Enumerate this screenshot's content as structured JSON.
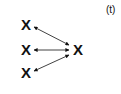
{
  "diagram": {
    "panel_label": "(t)",
    "nodes": [
      {
        "id": "left-top",
        "label": "X"
      },
      {
        "id": "left-middle",
        "label": "X"
      },
      {
        "id": "left-bottom",
        "label": "X"
      },
      {
        "id": "right",
        "label": "X"
      }
    ],
    "edges": [
      {
        "from": "left-top",
        "to": "right",
        "type": "bidirectional"
      },
      {
        "from": "left-middle",
        "to": "right",
        "type": "bidirectional"
      },
      {
        "from": "left-bottom",
        "to": "right",
        "type": "bidirectional"
      }
    ],
    "colors": {
      "ink": "#111111",
      "background": "#ffffff"
    }
  }
}
